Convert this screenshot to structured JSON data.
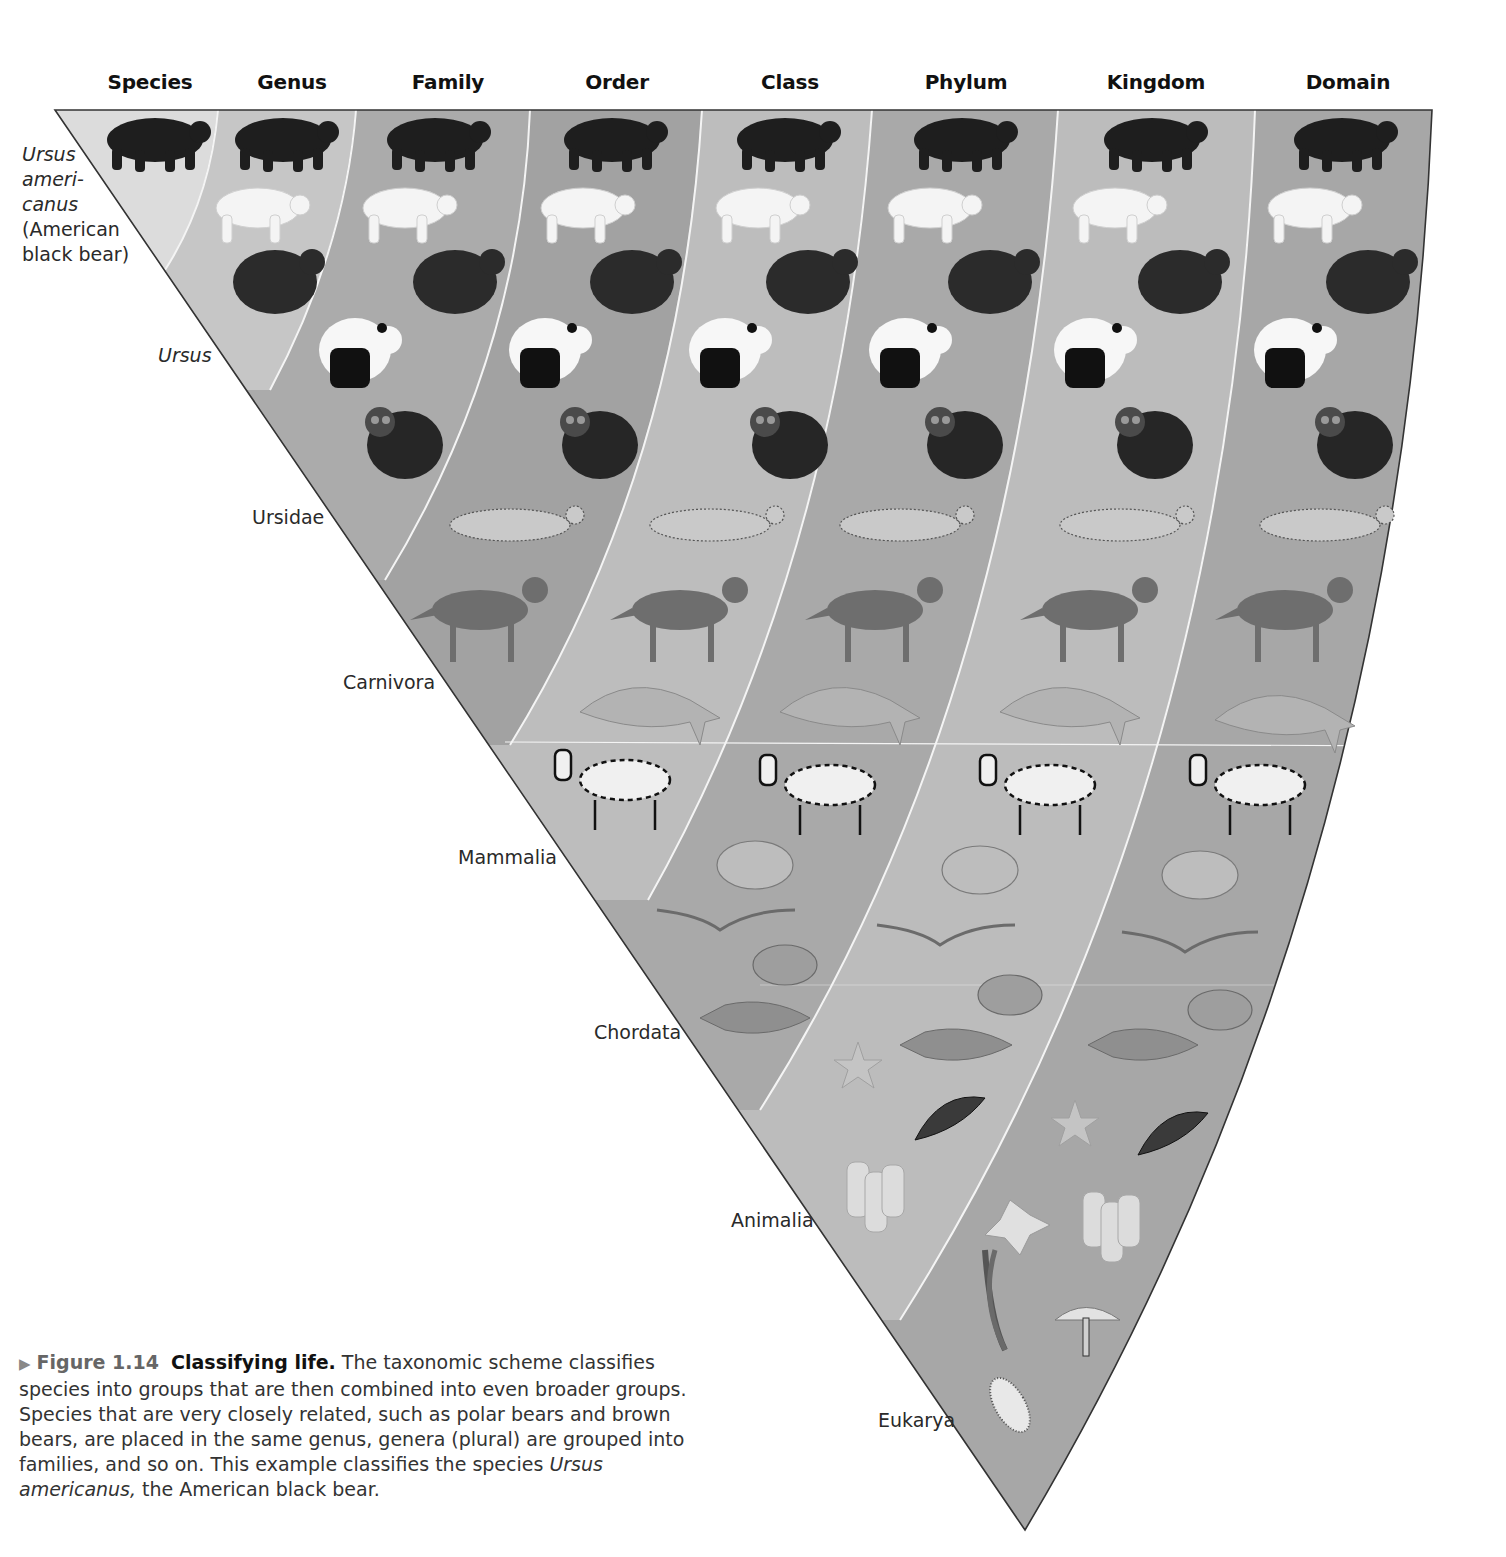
{
  "headers": [
    {
      "label": "Species",
      "x": 150
    },
    {
      "label": "Genus",
      "x": 292
    },
    {
      "label": "Family",
      "x": 448
    },
    {
      "label": "Order",
      "x": 617
    },
    {
      "label": "Class",
      "x": 790
    },
    {
      "label": "Phylum",
      "x": 966
    },
    {
      "label": "Kingdom",
      "x": 1156
    },
    {
      "label": "Domain",
      "x": 1348
    }
  ],
  "species_label": {
    "line1": "Ursus",
    "line2": "ameri-",
    "line3": "canus",
    "line4": "(American",
    "line5": "black bear)"
  },
  "rank_labels": {
    "genus": "Ursus",
    "family": "Ursidae",
    "order": "Carnivora",
    "class": "Mammalia",
    "phylum": "Chordata",
    "kingdom": "Animalia",
    "domain": "Eukarya"
  },
  "bands": [
    {
      "rank": "Species",
      "taxon": "Ursus americanus",
      "color": "#dcdcdc",
      "organisms": [
        "American black bear"
      ]
    },
    {
      "rank": "Genus",
      "taxon": "Ursus",
      "color": "#c6c6c6",
      "organisms": [
        "American black bear",
        "polar bear",
        "brown bear"
      ]
    },
    {
      "rank": "Family",
      "taxon": "Ursidae",
      "color": "#ababab",
      "organisms": [
        "American black bear",
        "polar bear",
        "brown bear",
        "giant panda",
        "spectacled bear"
      ]
    },
    {
      "rank": "Order",
      "taxon": "Carnivora",
      "color": "#a2a2a2",
      "organisms": [
        "American black bear",
        "polar bear",
        "brown bear",
        "giant panda",
        "spectacled bear",
        "leopard",
        "wolf"
      ]
    },
    {
      "rank": "Class",
      "taxon": "Mammalia",
      "color": "#bdbdbd",
      "organisms": [
        "American black bear",
        "polar bear",
        "brown bear",
        "giant panda",
        "spectacled bear",
        "leopard",
        "wolf",
        "dolphin",
        "zebra"
      ]
    },
    {
      "rank": "Phylum",
      "taxon": "Chordata",
      "color": "#a9a9a9",
      "organisms": [
        "American black bear",
        "polar bear",
        "brown bear",
        "giant panda",
        "spectacled bear",
        "leopard",
        "wolf",
        "dolphin",
        "zebra",
        "frog",
        "bird",
        "turtle",
        "fish"
      ]
    },
    {
      "rank": "Kingdom",
      "taxon": "Animalia",
      "color": "#bcbcbc",
      "organisms": [
        "American black bear",
        "polar bear",
        "brown bear",
        "giant panda",
        "spectacled bear",
        "leopard",
        "wolf",
        "dolphin",
        "zebra",
        "frog",
        "bird",
        "turtle",
        "fish",
        "sea star",
        "butterfly",
        "sponge"
      ]
    },
    {
      "rank": "Domain",
      "taxon": "Eukarya",
      "color": "#a7a7a7",
      "organisms": [
        "American black bear",
        "polar bear",
        "brown bear",
        "giant panda",
        "spectacled bear",
        "leopard",
        "wolf",
        "dolphin",
        "zebra",
        "frog",
        "bird",
        "turtle",
        "fish",
        "sea star",
        "butterfly",
        "sponge",
        "flower",
        "mushroom",
        "paramecium"
      ]
    }
  ],
  "caption": {
    "figure_number": "Figure 1.14",
    "title": "Classifying life.",
    "text1": " The taxonomic scheme classifies species into groups that are then combined into even broader groups. Species that are very closely related, such as polar bears and brown bears, are placed in the same genus, genera (plural) are grouped into families, and so on. This example classifies the species ",
    "italic": "Ursus americanus,",
    "text2": " the American black bear."
  }
}
